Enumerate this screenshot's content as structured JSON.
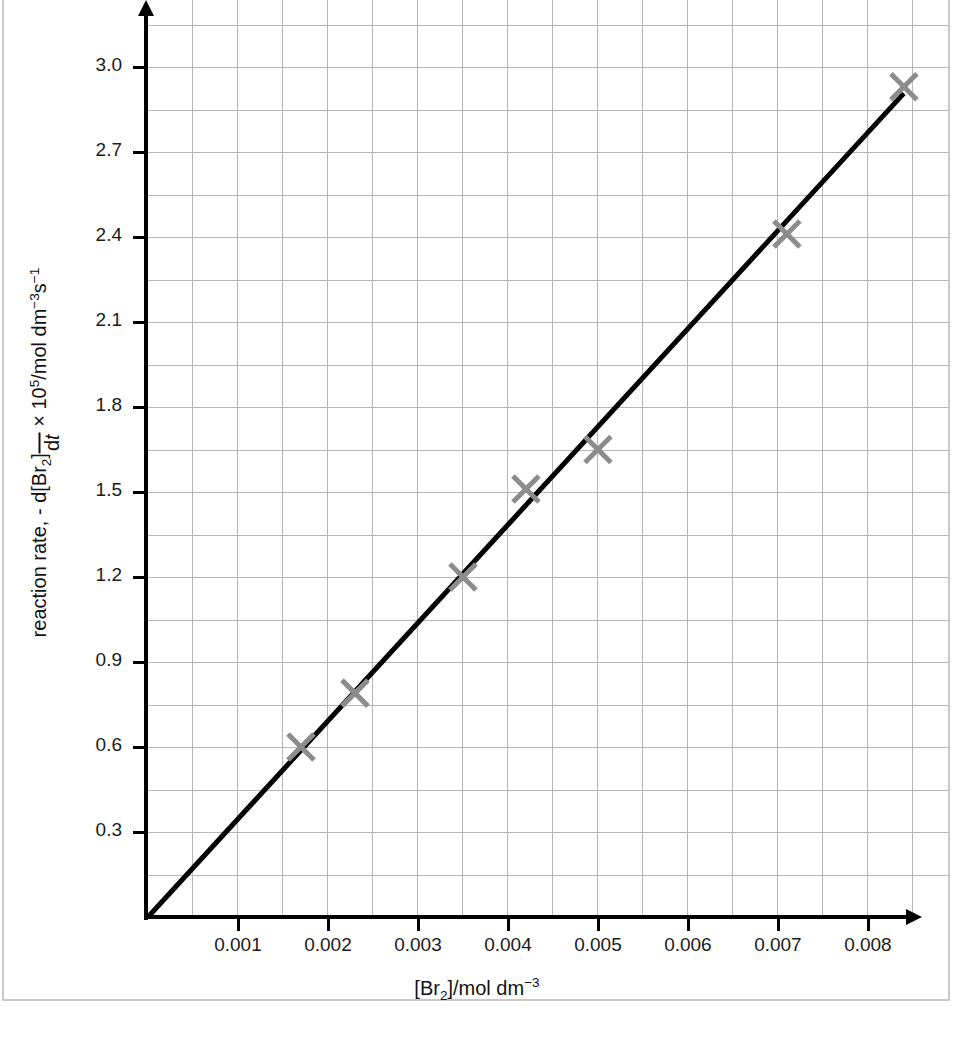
{
  "chart_data": {
    "type": "scatter",
    "title": "",
    "subtitle": "",
    "xlabel_parts": {
      "prefix": "[Br",
      "sub": "2",
      "mid": "]/mol dm",
      "sup": "−3"
    },
    "xlabel": "[Br2]/mol dm^-3",
    "ylabel_parts": {
      "lead": "reaction rate, - d[Br",
      "lead_sub": "2",
      "lead_tail": "]",
      "numerator_note": "numerator shown above fraction bar",
      "denominator": "d",
      "denominator_ital": "t",
      "trailing": " × 10",
      "trailing_sup": "5",
      "units": "/mol dm",
      "units_sup1": "−3",
      "units_mid": "s",
      "units_sup2": "−1"
    },
    "ylabel": "reaction rate, - d[Br2]/dt x 10^5 /mol dm^-3 s^-1",
    "x": [
      0.0017,
      0.0023,
      0.0035,
      0.0042,
      0.005,
      0.0071,
      0.0084
    ],
    "values": [
      0.6,
      0.79,
      1.2,
      1.51,
      1.65,
      2.41,
      2.93
    ],
    "series": [
      {
        "name": "measured rate",
        "marker": "cross",
        "marker_color": "#8c8c8c",
        "points": [
          {
            "x": 0.0017,
            "y": 0.6
          },
          {
            "x": 0.0023,
            "y": 0.79
          },
          {
            "x": 0.0035,
            "y": 1.2
          },
          {
            "x": 0.0042,
            "y": 1.51
          },
          {
            "x": 0.005,
            "y": 1.65
          },
          {
            "x": 0.0071,
            "y": 2.41
          },
          {
            "x": 0.0084,
            "y": 2.93
          }
        ]
      }
    ],
    "trend_line": {
      "name": "line of best fit through origin",
      "color": "#000000",
      "from": {
        "x": 0.0,
        "y": 0.0
      },
      "to": {
        "x": 0.00838,
        "y": 2.9
      },
      "slope_per_unit_x": 346
    },
    "xlim": [
      0.0,
      0.00889
    ],
    "ylim": [
      0.0,
      3.236
    ],
    "xticks": [
      0.001,
      0.002,
      0.003,
      0.004,
      0.005,
      0.006,
      0.007,
      0.008
    ],
    "xtick_labels": [
      "0.001",
      "0.002",
      "0.003",
      "0.004",
      "0.005",
      "0.006",
      "0.007",
      "0.008"
    ],
    "yticks": [
      0.3,
      0.6,
      0.9,
      1.2,
      1.5,
      1.8,
      2.1,
      2.4,
      2.7,
      3.0
    ],
    "ytick_labels": [
      "0.3",
      "0.6",
      "0.9",
      "1.2",
      "1.5",
      "1.8",
      "2.1",
      "2.4",
      "2.7",
      "3.0"
    ],
    "grid": true,
    "grid_color": "#b6b6b6",
    "grid_minor_x_step": 0.0005,
    "grid_minor_y_step": 0.15,
    "legend": "none",
    "legend_position": "none",
    "background_color": "#ffffff",
    "axis_color": "#000000",
    "annotations": []
  },
  "axes": {
    "x_tick_labels": [
      "0.001",
      "0.002",
      "0.003",
      "0.004",
      "0.005",
      "0.006",
      "0.007",
      "0.008"
    ],
    "y_tick_labels": [
      "0.3",
      "0.6",
      "0.9",
      "1.2",
      "1.5",
      "1.8",
      "2.1",
      "2.4",
      "2.7",
      "3.0"
    ]
  },
  "x_title": {
    "prefix": "[Br",
    "sub": "2",
    "mid": "]/mol dm",
    "sup": "−3"
  },
  "y_title": {
    "lead": "reaction rate, - d[Br",
    "lead_sub": "2",
    "lead_close": "]",
    "den_d": "d",
    "den_t": "t",
    "times": " × 10",
    "exp5": "5",
    "units": "/mol dm",
    "units_sup1": "−3",
    "units_s": "s",
    "units_sup2": "−1"
  }
}
